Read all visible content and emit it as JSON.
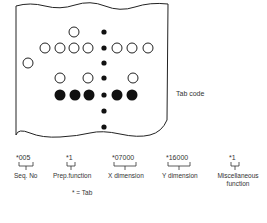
{
  "tape": {
    "label": "Tab code",
    "rows": [
      {
        "y": 32,
        "open": [
          74
        ],
        "filled": []
      },
      {
        "y": 48,
        "open": [
          45,
          60,
          74,
          88,
          117,
          132,
          148
        ],
        "filled": []
      },
      {
        "y": 63,
        "open": [
          28
        ],
        "filled": []
      },
      {
        "y": 78,
        "open": [
          60,
          88,
          133
        ],
        "filled": []
      },
      {
        "y": 95,
        "open": [],
        "filled": [
          60,
          75,
          89,
          117,
          132
        ]
      }
    ],
    "sprocket_x": 104,
    "sprocket_y": [
      32,
      48,
      63,
      78,
      95,
      111,
      127
    ]
  },
  "fields": [
    {
      "code": "*005",
      "label": "Seq. No"
    },
    {
      "code": "*1",
      "label": "Prep.function"
    },
    {
      "code": "*07000",
      "label": "X dimension"
    },
    {
      "code": "*16000",
      "label": "Y dimension"
    },
    {
      "code": "*1",
      "label": "Miscellaneous function"
    }
  ],
  "legend": "* = Tab"
}
